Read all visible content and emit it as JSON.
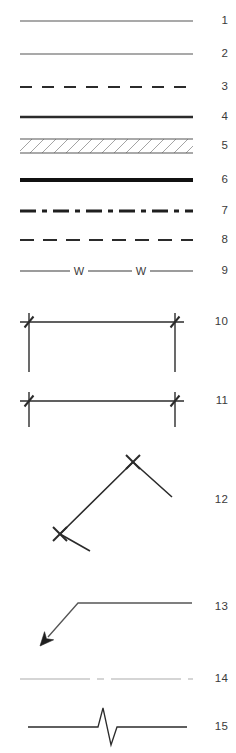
{
  "legend": {
    "title": "Line type legend",
    "description": "Technical drawing line-style key with fifteen numbered sample lines",
    "canvas": {
      "width": 236,
      "height": 753,
      "background": "#ffffff"
    },
    "sample_area": {
      "left": 20,
      "right": 193
    },
    "colors": {
      "line_dark": "#2b2b2b",
      "line_medium": "#4a4a4a",
      "line_gray": "#555555",
      "line_faint": "#c8c8c8",
      "hatch": "#9a9a9a",
      "number_text": "#3a3a3a"
    },
    "items": [
      {
        "number": "1",
        "style": "solid-thin",
        "label": "Solid thin line",
        "y_center": 21,
        "row_top": 4,
        "row_height": 34,
        "stroke": "#555555",
        "stroke_width": 1.1
      },
      {
        "number": "2",
        "style": "solid-thin",
        "label": "Solid thin line",
        "y_center": 54,
        "row_top": 38,
        "row_height": 33,
        "stroke": "#555555",
        "stroke_width": 1.2
      },
      {
        "number": "3",
        "style": "dashed",
        "label": "Dashed line",
        "y_center": 87,
        "row_top": 71,
        "row_height": 33,
        "stroke": "#2b2b2b",
        "stroke_width": 2.0,
        "dash_pattern": "12 10"
      },
      {
        "number": "4",
        "style": "solid-medium",
        "label": "Solid medium line",
        "y_center": 117,
        "row_top": 104,
        "row_height": 28,
        "stroke": "#2b2b2b",
        "stroke_width": 2.3
      },
      {
        "number": "5",
        "style": "hatched-band",
        "label": "Hatched band between two thin lines",
        "y_center": 146,
        "row_top": 132,
        "row_height": 32,
        "stroke": "#555555",
        "stroke_width": 1.1,
        "band_height": 14,
        "hatch_color": "#9a9a9a",
        "hatch_spacing": 12
      },
      {
        "number": "6",
        "style": "solid-thick",
        "label": "Solid thick line",
        "y_center": 180,
        "row_top": 164,
        "row_height": 31,
        "stroke": "#111111",
        "stroke_width": 4.0
      },
      {
        "number": "7",
        "style": "dash-dot",
        "label": "Dash-dot line",
        "y_center": 211,
        "row_top": 195,
        "row_height": 32,
        "stroke": "#1f1f1f",
        "stroke_width": 3.0,
        "dash_pattern": "16 6 5 6"
      },
      {
        "number": "8",
        "style": "dashed",
        "label": "Dashed line",
        "y_center": 240,
        "row_top": 227,
        "row_height": 30,
        "stroke": "#2b2b2b",
        "stroke_width": 2.1,
        "dash_pattern": "14 9"
      },
      {
        "number": "9",
        "style": "line-with-letters",
        "label": "Line interrupted by letter W",
        "y_center": 271,
        "row_top": 257,
        "row_height": 32,
        "stroke": "#3a3a3a",
        "stroke_width": 1.2,
        "letter": "W",
        "letter_positions": [
          79,
          141
        ]
      },
      {
        "number": "10",
        "style": "dimension-long",
        "label": "Dimension line with slash ticks and long extension lines",
        "y_center": 322,
        "row_top": 296,
        "row_height": 62,
        "stroke": "#2b2b2b",
        "stroke_width": 1.4,
        "x_start": 29,
        "x_end": 175,
        "extension_length": 50,
        "tick_overshoot": 9
      },
      {
        "number": "11",
        "style": "dimension-short",
        "label": "Dimension line with slash ticks and short extension lines",
        "y_center": 401,
        "row_top": 382,
        "row_height": 42,
        "stroke": "#2b2b2b",
        "stroke_width": 1.4,
        "x_start": 29,
        "x_end": 175,
        "extension_length": 26,
        "tick_overshoot": 9
      },
      {
        "number": "12",
        "style": "polyline-cross-vertices",
        "label": "Zigzag polyline with cross markers at vertices",
        "y_center": 500,
        "row_top": 440,
        "row_height": 120,
        "stroke": "#2b2b2b",
        "stroke_width": 1.6,
        "points": "90,551 60,534 133,462 172,497",
        "vertices": [
          [
            60,
            534
          ],
          [
            133,
            462
          ]
        ],
        "marker": "x-cross",
        "marker_size": 7
      },
      {
        "number": "13",
        "style": "leader-arrow",
        "label": "Leader line with filled arrowhead",
        "y_center": 607,
        "row_top": 580,
        "row_height": 72,
        "stroke": "#555555",
        "stroke_width": 1.3,
        "points": "192,603 78,603 48,637",
        "arrow_tip": [
          40,
          646
        ],
        "arrow_fill": "#1f1f1f"
      },
      {
        "number": "14",
        "style": "faint-dash-dot",
        "label": "Faint light gray dash-dot line",
        "y_center": 679,
        "row_top": 660,
        "row_height": 38,
        "stroke": "#c8c8c8",
        "stroke_width": 1.6,
        "dash_pattern": "70 7 7 7"
      },
      {
        "number": "15",
        "style": "break-line",
        "label": "Line with zigzag break symbol",
        "y_center": 727,
        "row_top": 700,
        "row_height": 53,
        "stroke": "#2b2b2b",
        "stroke_width": 1.3,
        "break_path": "28,727 98,727 103,708 111,745 117,727 187,727"
      }
    ]
  }
}
